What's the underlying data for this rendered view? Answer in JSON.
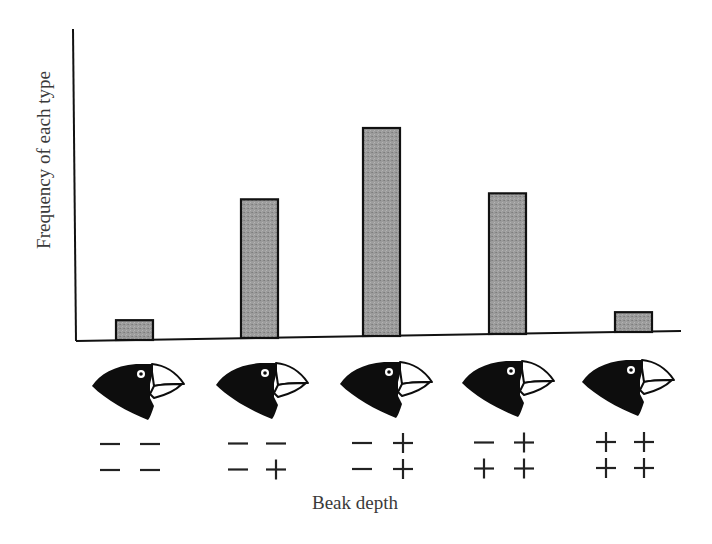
{
  "chart_data": {
    "type": "bar",
    "title": "",
    "xlabel": "Beak depth",
    "ylabel": "Frequency of each type",
    "categories": [
      "- - / - -",
      "- - / - +",
      "- + / - +",
      "- + / + +",
      "+ + / + +"
    ],
    "genotypes": [
      [
        [
          "-",
          "-"
        ],
        [
          "-",
          "-"
        ]
      ],
      [
        [
          "-",
          "-"
        ],
        [
          "-",
          "+"
        ]
      ],
      [
        [
          "-",
          "+"
        ],
        [
          "-",
          "+"
        ]
      ],
      [
        [
          "-",
          "+"
        ],
        [
          "+",
          "+"
        ]
      ],
      [
        [
          "+",
          "+"
        ],
        [
          "+",
          "+"
        ]
      ]
    ],
    "values": [
      1,
      7,
      10.5,
      7.1,
      1
    ],
    "relative_heights_px": [
      20,
      138,
      208,
      141,
      19
    ],
    "ylim": [
      0,
      15
    ],
    "grid": false,
    "legend": "none",
    "y_ticks": false,
    "bar_fill": "#9a9a9a",
    "bar_stroke": "#111111",
    "icons": [
      "finch-head-shallow-beak",
      "finch-head-beak",
      "finch-head-beak",
      "finch-head-beak",
      "finch-head-deep-beak"
    ]
  },
  "labels": {
    "ylabel": "Frequency of each type",
    "xlabel": "Beak depth"
  }
}
